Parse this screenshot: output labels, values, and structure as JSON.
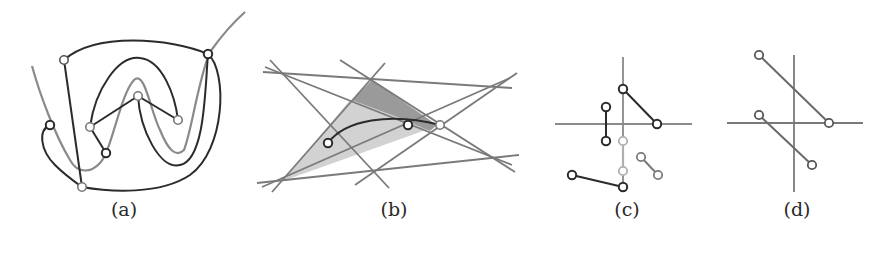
{
  "figure": {
    "panels": [
      {
        "id": "a",
        "caption": "(a)",
        "caption_x": 124,
        "caption_y": 198
      },
      {
        "id": "b",
        "caption": "(b)",
        "caption_x": 394,
        "caption_y": 198
      },
      {
        "id": "c",
        "caption": "(c)",
        "caption_x": 627,
        "caption_y": 198
      },
      {
        "id": "d",
        "caption": "(d)",
        "caption_x": 797,
        "caption_y": 198
      }
    ]
  },
  "colors": {
    "black": "#2b2b2b",
    "gray": "#8a8a8a",
    "light_gray": "#b0b0b0",
    "fill_light": "#cfcfcf",
    "fill_dark": "#9a9a9a",
    "node_fill": "#ffffff"
  }
}
